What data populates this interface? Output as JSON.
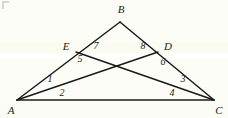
{
  "figure": {
    "background_color": "#fdfdf8",
    "stroke_color": "#1a1a1a",
    "label_color": "#1a1a1a",
    "width": 228,
    "height": 118,
    "points": {
      "A": {
        "x": 17,
        "y": 100
      },
      "B": {
        "x": 120,
        "y": 22
      },
      "C": {
        "x": 214,
        "y": 100
      },
      "D": {
        "x": 158,
        "y": 52
      },
      "E": {
        "x": 76,
        "y": 52
      }
    },
    "segments": [
      {
        "name": "side-AB",
        "from": "A",
        "to": "B"
      },
      {
        "name": "side-BC",
        "from": "B",
        "to": "C"
      },
      {
        "name": "side-AC",
        "from": "A",
        "to": "C"
      },
      {
        "name": "cevian-AD",
        "from": "A",
        "to": "D"
      },
      {
        "name": "cevian-CE",
        "from": "C",
        "to": "E"
      }
    ],
    "vertex_labels": [
      {
        "name": "vertex-label-B",
        "text": "B",
        "x": 121,
        "y": 9
      },
      {
        "name": "vertex-label-E",
        "text": "E",
        "x": 66,
        "y": 46
      },
      {
        "name": "vertex-label-D",
        "text": "D",
        "x": 168,
        "y": 46
      },
      {
        "name": "vertex-label-A",
        "text": "A",
        "x": 11,
        "y": 110
      },
      {
        "name": "vertex-label-C",
        "text": "C",
        "x": 219,
        "y": 110
      }
    ],
    "angle_labels": [
      {
        "name": "angle-label-7",
        "text": "7",
        "x": 96,
        "y": 46
      },
      {
        "name": "angle-label-8",
        "text": "8",
        "x": 143,
        "y": 46
      },
      {
        "name": "angle-label-5",
        "text": "5",
        "x": 80,
        "y": 59
      },
      {
        "name": "angle-label-6",
        "text": "6",
        "x": 163,
        "y": 62
      },
      {
        "name": "angle-label-1",
        "text": "1",
        "x": 50,
        "y": 79
      },
      {
        "name": "angle-label-3",
        "text": "3",
        "x": 183,
        "y": 79
      },
      {
        "name": "angle-label-2",
        "text": "2",
        "x": 62,
        "y": 93
      },
      {
        "name": "angle-label-4",
        "text": "4",
        "x": 172,
        "y": 93
      }
    ]
  }
}
